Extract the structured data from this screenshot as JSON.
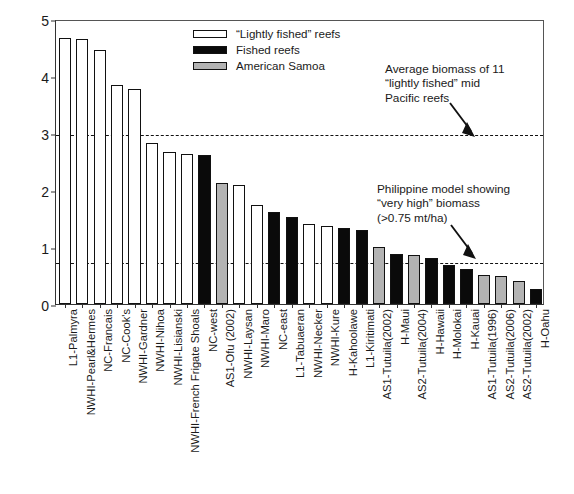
{
  "chart_data": {
    "type": "bar",
    "title": "",
    "xlabel": "",
    "ylabel": "Fish biomass (mt/ha)",
    "ylim": [
      0,
      5
    ],
    "yticks": [
      0,
      1,
      2,
      3,
      4,
      5
    ],
    "grid": false,
    "legend_position": "top-center",
    "categories": [
      "L1-Palmyra",
      "NWHI-Pearl&Hermes",
      "NC-Francais",
      "NC-Cook's",
      "NWHI-Gardner",
      "NWHI-Nihoa",
      "NWHI-Lisianski",
      "NWHI-French Frigate Shoals",
      "NC-west",
      "AS1-Ofu (2002)",
      "NWHI-Laysan",
      "NWHI-Maro",
      "NC-east",
      "L1-Tabuaeran",
      "NWHI-Necker",
      "NWHI-Kure",
      "H-Kahoolawe",
      "L1-Kiritimati",
      "AS1-Tutuila(2002)",
      "H-Maui",
      "AS2-Tutuila(2004)",
      "H-Hawaii",
      "H-Molokai",
      "H-Kauai",
      "AS1-Tutuila(1996)",
      "AS2-Tutuila(2006)",
      "AS2-Tutuila(2002)",
      "H-Oahu"
    ],
    "values": [
      4.66,
      4.65,
      4.45,
      3.85,
      3.77,
      2.83,
      2.66,
      2.64,
      2.62,
      2.12,
      2.08,
      1.73,
      1.62,
      1.52,
      1.41,
      1.36,
      1.33,
      1.3,
      1.0,
      0.88,
      0.86,
      0.8,
      0.68,
      0.62,
      0.51,
      0.49,
      0.41,
      0.27
    ],
    "bar_groups": [
      "light",
      "light",
      "light",
      "light",
      "light",
      "light",
      "light",
      "light",
      "fished",
      "samoa",
      "light",
      "light",
      "fished",
      "fished",
      "light",
      "light",
      "fished",
      "fished",
      "samoa",
      "fished",
      "samoa",
      "fished",
      "fished",
      "fished",
      "samoa",
      "samoa",
      "samoa",
      "fished"
    ],
    "series": [
      {
        "name": "“Lightly fished” reefs",
        "key": "light",
        "color": "#ffffff"
      },
      {
        "name": "Fished reefs",
        "key": "fished",
        "color": "#0a0a0a"
      },
      {
        "name": "American Samoa",
        "key": "samoa",
        "color": "#b3b3b3"
      }
    ],
    "reference_lines": [
      {
        "value": 3.0,
        "style": "dashed",
        "label": "Average biomass of 11 “lightly fished” mid Pacific reefs"
      },
      {
        "value": 0.75,
        "style": "dashed",
        "label": "Philippine model showing “very high” biomass (>0.75 mt/ha)"
      }
    ],
    "annotations": [
      {
        "text": "Average biomass of 11\n“lightly fished” mid\nPacific reefs",
        "target_value": 3.0
      },
      {
        "text": "Philippine model showing\n“very high” biomass\n(>0.75 mt/ha)",
        "target_value": 0.75
      }
    ]
  },
  "axis": {
    "y_title": "Fish biomass (mt/ha)"
  },
  "legend": {
    "items": [
      {
        "label": "“Lightly fished” reefs",
        "key": "light"
      },
      {
        "label": "Fished reefs",
        "key": "fished"
      },
      {
        "label": "American Samoa",
        "key": "samoa"
      }
    ]
  },
  "colors": {
    "light": "#ffffff",
    "fished": "#0a0a0a",
    "samoa": "#b3b3b3",
    "axis": "#333333",
    "background": "#ffffff"
  }
}
